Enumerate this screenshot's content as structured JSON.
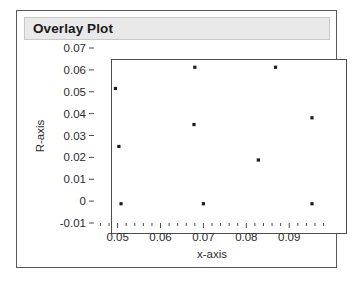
{
  "window": {
    "title": "Overlay Plot"
  },
  "chart_data": {
    "type": "scatter",
    "title": "Overlay Plot",
    "xlabel": "x-axis",
    "ylabel": "R-axis",
    "xlim": [
      0.0445,
      0.0995
    ],
    "ylim": [
      -0.01,
      0.07
    ],
    "grid": false,
    "legend": "none",
    "x_ticks": [
      "0.05",
      "0.06",
      "0.07",
      "0.08",
      "0.09"
    ],
    "x_tick_values": [
      0.05,
      0.06,
      0.07,
      0.08,
      0.09
    ],
    "x_minor_ticks_per_interval": 4,
    "y_ticks": [
      "0.07",
      "0.06",
      "0.05",
      "0.04",
      "0.03",
      "0.02",
      "0.01",
      "0",
      "-0.01"
    ],
    "y_tick_values": [
      0.07,
      0.06,
      0.05,
      0.04,
      0.03,
      0.02,
      0.01,
      0,
      -0.01
    ],
    "marker": "filled-square",
    "marker_color": "#1c1c1c",
    "points": [
      {
        "x": 0.0495,
        "y": 0.0515
      },
      {
        "x": 0.0503,
        "y": 0.025
      },
      {
        "x": 0.0508,
        "y": -0.0012
      },
      {
        "x": 0.068,
        "y": 0.0612
      },
      {
        "x": 0.0678,
        "y": 0.035
      },
      {
        "x": 0.07,
        "y": -0.0012
      },
      {
        "x": 0.0828,
        "y": 0.0188
      },
      {
        "x": 0.0868,
        "y": 0.0612
      },
      {
        "x": 0.0953,
        "y": 0.0381
      },
      {
        "x": 0.0953,
        "y": -0.0012
      }
    ]
  },
  "colors": {
    "panel_border": "#5a5a5a",
    "title_bar_bg": "#e9e9e9",
    "axis": "#4d4d4d",
    "text": "#2b2b2b"
  }
}
